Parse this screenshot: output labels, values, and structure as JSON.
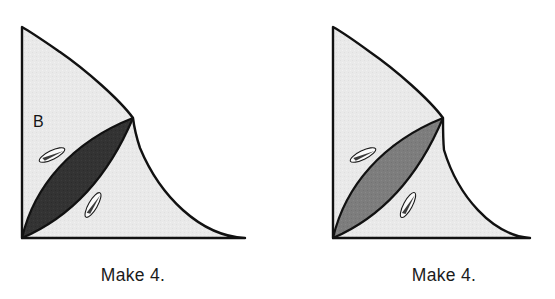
{
  "page": {
    "kind": "quilting-instruction-diagram",
    "background_color": "#ffffff",
    "width": 555,
    "height": 299
  },
  "palette": {
    "outline": "#111111",
    "background_patch": "#e9e9e9",
    "dark_patch": "#333333",
    "medium_gray_patch": "#7d7d7d",
    "pin_fill": "#fbfbfb",
    "pin_outline": "#1a1a1a",
    "text_color": "#1b1b1b"
  },
  "figures": [
    {
      "id": "left",
      "caption": "Make 4.",
      "piece_label": "B",
      "lens_fill": "#333333",
      "lens_shade_name": "dark",
      "background_fill": "#e9e9e9",
      "pins": 2,
      "geometry": {
        "apex": [
          22,
          27
        ],
        "corner": [
          22,
          238
        ],
        "baseline_end": [
          245,
          238
        ],
        "cusp": [
          133,
          118
        ]
      }
    },
    {
      "id": "right",
      "caption": "Make 4.",
      "piece_label": "",
      "lens_fill": "#7d7d7d",
      "lens_shade_name": "medium-gray",
      "background_fill": "#e9e9e9",
      "pins": 2,
      "geometry": {
        "apex": [
          333,
          27
        ],
        "corner": [
          333,
          238
        ],
        "baseline_end": [
          530,
          238
        ],
        "cusp": [
          443,
          118
        ]
      }
    }
  ],
  "captions": {
    "left": "Make 4.",
    "right": "Make 4."
  },
  "labels": {
    "piece_b": "B"
  }
}
